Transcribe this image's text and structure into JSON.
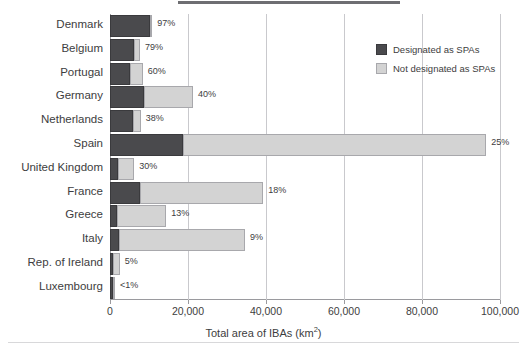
{
  "chart_data": {
    "type": "bar",
    "orientation": "horizontal",
    "stacked": true,
    "title": "",
    "xlabel": "Total area of IBAs (km²)",
    "ylabel": "",
    "xlim": [
      0,
      100000
    ],
    "xticks": [
      0,
      20000,
      40000,
      60000,
      80000,
      100000
    ],
    "xtick_labels": [
      "0",
      "20,000",
      "40,000",
      "60,000",
      "80,000",
      "100,000"
    ],
    "grid": "vertical",
    "legend_position": "upper right",
    "categories": [
      "Denmark",
      "Belgium",
      "Portugal",
      "Germany",
      "Netherlands",
      "Spain",
      "United Kingdom",
      "France",
      "Greece",
      "Italy",
      "Rep. of Ireland",
      "Luxembourg"
    ],
    "series": [
      {
        "name": "Designated as SPAs",
        "color": "#4a4a4d",
        "values": [
          10300,
          6200,
          5200,
          8800,
          6000,
          18700,
          2100,
          7800,
          1800,
          2300,
          500,
          120
        ]
      },
      {
        "name": "Not designated as SPAs",
        "color": "#d3d3d3",
        "values": [
          300,
          1500,
          3200,
          12500,
          1900,
          77800,
          4100,
          31500,
          12600,
          32300,
          2000,
          480
        ]
      }
    ],
    "data_labels": [
      "97%",
      "79%",
      "60%",
      "40%",
      "38%",
      "25%",
      "30%",
      "18%",
      "13%",
      "9%",
      "5%",
      "<1%"
    ],
    "data_label_meaning": "percentage of IBA area designated as SPAs",
    "bars": [
      {
        "category": "Denmark",
        "dark_end": 10300,
        "total": 10600,
        "label": "97%"
      },
      {
        "category": "Belgium",
        "dark_end": 6200,
        "total": 7700,
        "label": "79%"
      },
      {
        "category": "Portugal",
        "dark_end": 5200,
        "total": 8400,
        "label": "60%"
      },
      {
        "category": "Germany",
        "dark_end": 8800,
        "total": 21300,
        "label": "40%"
      },
      {
        "category": "Netherlands",
        "dark_end": 6000,
        "total": 7900,
        "label": "38%"
      },
      {
        "category": "Spain",
        "dark_end": 18700,
        "total": 96500,
        "label": "25%"
      },
      {
        "category": "United Kingdom",
        "dark_end": 2100,
        "total": 6200,
        "label": "30%"
      },
      {
        "category": "France",
        "dark_end": 7800,
        "total": 39300,
        "label": "18%"
      },
      {
        "category": "Greece",
        "dark_end": 1800,
        "total": 14400,
        "label": "13%"
      },
      {
        "category": "Italy",
        "dark_end": 2300,
        "total": 34600,
        "label": "9%"
      },
      {
        "category": "Rep. of Ireland",
        "dark_end": 500,
        "total": 2500,
        "label": "5%"
      },
      {
        "category": "Luxembourg",
        "dark_end": 120,
        "total": 600,
        "label": "<1%"
      }
    ]
  },
  "legend": {
    "items": [
      {
        "label": "Designated as SPAs",
        "color": "#4a4a4d"
      },
      {
        "label": "Not designated as SPAs",
        "color": "#d3d3d3"
      }
    ]
  },
  "axis": {
    "x_title_main": "Total area of IBAs (km",
    "x_title_sup": "2",
    "x_title_close": ")"
  }
}
